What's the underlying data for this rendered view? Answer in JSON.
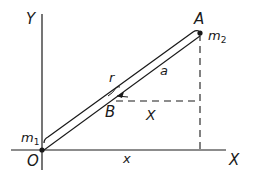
{
  "diagram": {
    "axes": {
      "x_label": "X",
      "y_label": "Y",
      "origin_label": "O"
    },
    "points": {
      "A": {
        "label": "A",
        "mass_label": "m",
        "mass_sub": "2"
      },
      "O": {
        "mass_label": "m",
        "mass_sub": "1"
      },
      "B": {
        "label": "B"
      }
    },
    "segment_labels": {
      "r": "r",
      "a": "a",
      "X_upper": "X",
      "x_lower": "x"
    },
    "colors": {
      "line": "#1a1a1a",
      "background": "#ffffff"
    }
  }
}
